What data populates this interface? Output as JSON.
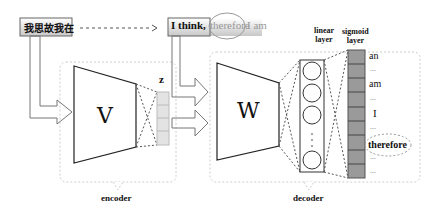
{
  "input_box": {
    "text": "我思故我在"
  },
  "output_box": {
    "prefix": "I think,",
    "highlighted": "therefore",
    "suffix": "I am"
  },
  "encoder": {
    "label": "encoder",
    "matrix": "V",
    "latent": "z"
  },
  "decoder": {
    "label": "decoder",
    "matrix": "W"
  },
  "linear_layer": {
    "label_line1": "linear",
    "label_line2": "layer"
  },
  "sigmoid_layer": {
    "label_line1": "sigmoid",
    "label_line2": "layer"
  },
  "vocab_outputs": [
    "an",
    "...",
    "am",
    "...",
    "I",
    "...",
    "therefore",
    "...",
    "..."
  ]
}
